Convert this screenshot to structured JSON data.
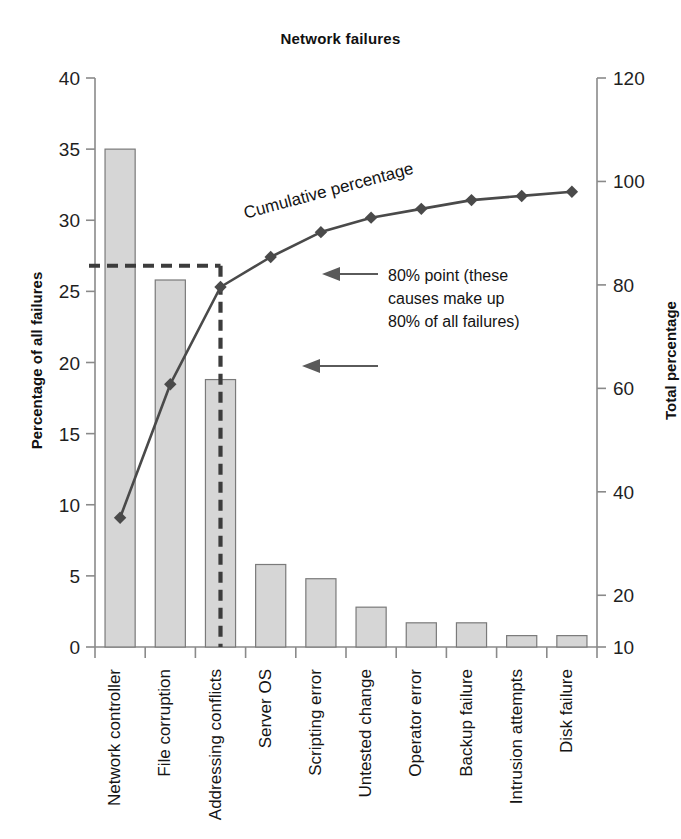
{
  "chart_data": {
    "type": "bar",
    "title": "Network failures",
    "xlabel": "",
    "ylabel": "Percentage of all failures",
    "y2label": "Total percentage",
    "ylim": [
      0,
      40
    ],
    "y2lim": [
      10,
      120
    ],
    "grid": false,
    "legend": "none",
    "categories": [
      "Network controller",
      "File corruption",
      "Addressing conflicts",
      "Server OS",
      "Scripting error",
      "Untested change",
      "Operator error",
      "Backup failure",
      "Intrusion attempts",
      "Disk failure"
    ],
    "values": [
      35.0,
      25.8,
      18.8,
      5.8,
      4.8,
      2.8,
      1.7,
      1.7,
      0.8,
      0.8
    ],
    "series": [
      {
        "name": "Percentage of all failures",
        "axis": "left",
        "type": "bar",
        "values": [
          35.0,
          25.8,
          18.8,
          5.8,
          4.8,
          2.8,
          1.7,
          1.7,
          0.8,
          0.8
        ]
      },
      {
        "name": "Cumulative percentage",
        "axis": "right",
        "type": "line",
        "values": [
          35.0,
          60.8,
          79.6,
          85.4,
          90.2,
          93.0,
          94.7,
          96.4,
          97.2,
          98.0
        ]
      }
    ],
    "y_ticks": [
      0,
      5,
      10,
      15,
      20,
      25,
      30,
      35,
      40
    ],
    "y2_ticks": [
      10,
      20,
      40,
      60,
      80,
      100,
      120
    ],
    "annotations": [
      {
        "name": "cumulative-percentage-label",
        "text": "Cumulative percentage"
      },
      {
        "name": "eighty-percent-note",
        "lines": [
          "80% point (these",
          "causes make up",
          "80% of all failures)"
        ]
      }
    ],
    "guides": {
      "eighty_percent_horizontal": 26.8,
      "eighty_percent_vertical_category": "Addressing conflicts"
    },
    "colors": {
      "bar_fill": "#d6d6d6",
      "bar_stroke": "#7a7a7a",
      "line": "#4a4a4a",
      "guide_dash": "#3c3c3c",
      "axis": "#8a8a8a",
      "text": "#141414",
      "background": "#ffffff"
    }
  }
}
